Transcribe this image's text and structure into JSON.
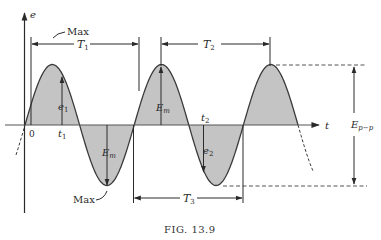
{
  "figure": {
    "caption": "FIG. 13.9",
    "axes": {
      "y_label": "e",
      "x_label": "t",
      "origin_label": "0"
    },
    "colors": {
      "fill": "#c4c4c4",
      "stroke": "#3a3a3a",
      "background": "#ffffff"
    },
    "labels": {
      "max_top": "Max",
      "max_bottom": "Max",
      "t1": "t",
      "t1_sub": "1",
      "e1": "e",
      "e1_sub": "1",
      "t2": "t",
      "t2_sub": "2",
      "e2": "e",
      "e2_sub": "2",
      "em_top": "E",
      "em_top_sub": "m",
      "em_bottom": "E",
      "em_bottom_sub": "m",
      "epp": "E",
      "epp_sub": "p−p",
      "T1": "T",
      "T1_sub": "1",
      "T2": "T",
      "T2_sub": "2",
      "T3": "T",
      "T3_sub": "3"
    }
  },
  "chart_data": {
    "type": "line",
    "title": "FIG. 13.9",
    "xlabel": "t",
    "ylabel": "e",
    "series": [
      {
        "name": "e(t)",
        "function": "Em sin(2πt/T)",
        "cycles_shown": 2.5
      }
    ],
    "annotations": [
      "Max",
      "Max",
      "T1",
      "T2",
      "T3",
      "Em",
      "Em",
      "e1",
      "e2",
      "t1",
      "t2",
      "Ep-p",
      "0"
    ]
  }
}
